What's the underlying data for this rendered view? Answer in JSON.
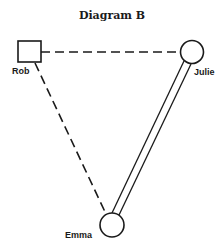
{
  "title": "Diagram B",
  "nodes": [
    {
      "id": "rob",
      "label": "Rob",
      "shape": "square",
      "sex": "male"
    },
    {
      "id": "julie",
      "label": "Julie",
      "shape": "circle",
      "sex": "female"
    },
    {
      "id": "emma",
      "label": "Emma",
      "shape": "circle",
      "sex": "female"
    }
  ],
  "edges": [
    {
      "from": "Rob",
      "to": "Julie",
      "style": "dashed"
    },
    {
      "from": "Rob",
      "to": "Emma",
      "style": "dashed"
    },
    {
      "from": "Julie",
      "to": "Emma",
      "style": "double-line"
    }
  ],
  "colors": {
    "stroke": "#1a1a1a",
    "background": "#ffffff"
  }
}
